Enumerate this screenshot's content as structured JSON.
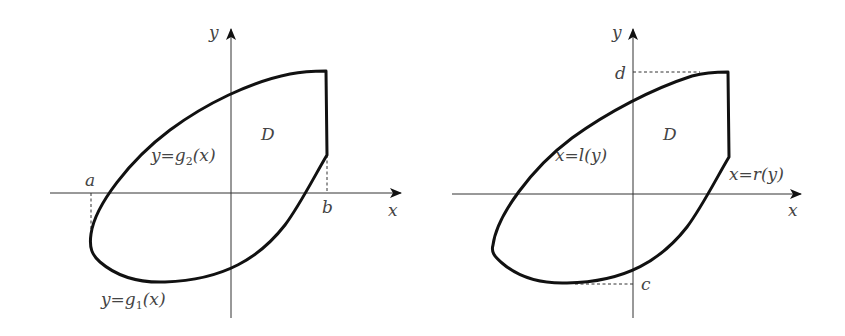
{
  "panels": [
    {
      "name": "type-I-region",
      "axes": {
        "x_label": "x",
        "y_label": "y"
      },
      "region_label": "D",
      "boundary_labels": {
        "upper": {
          "text": "y=g",
          "sub": "2",
          "tail": "(x)"
        },
        "lower": {
          "text": "y=g",
          "sub": "1",
          "tail": "(x)"
        }
      },
      "bounds": {
        "left": "a",
        "right": "b"
      }
    },
    {
      "name": "type-II-region",
      "axes": {
        "x_label": "x",
        "y_label": "y"
      },
      "region_label": "D",
      "boundary_labels": {
        "left": "x=l(y)",
        "right": "x=r(y)"
      },
      "bounds": {
        "bottom": "c",
        "top": "d"
      }
    }
  ],
  "colors": {
    "curve": "#111111",
    "axis": "#333333",
    "label": "#444444"
  }
}
